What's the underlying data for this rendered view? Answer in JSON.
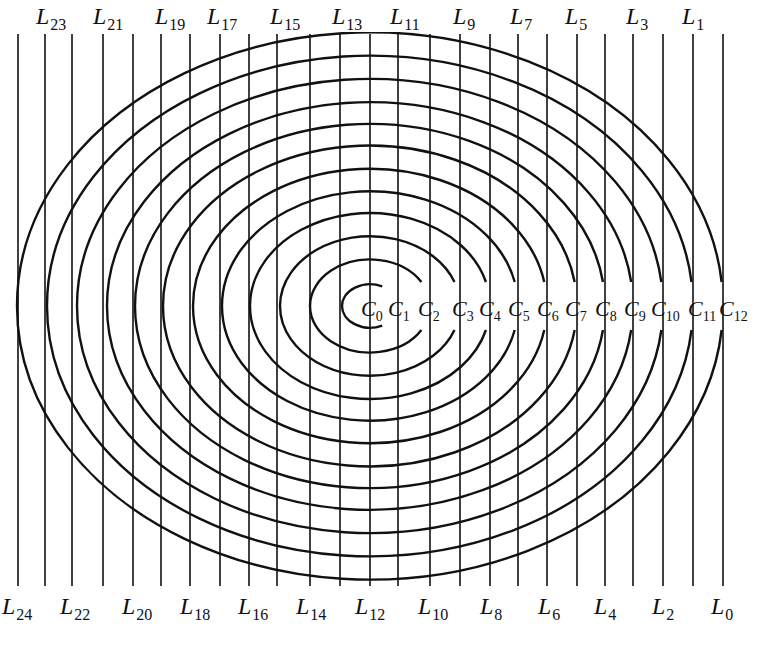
{
  "figure": {
    "center": {
      "x": 370,
      "y": 306
    },
    "y_scale": 0.775,
    "line_top": 34,
    "line_bottom": 586,
    "clip": {
      "top": 32,
      "bottom": 588
    },
    "stroke_color": "#111111",
    "line_x": [
      723,
      693,
      663,
      633,
      605,
      577,
      547,
      518,
      490,
      460,
      430,
      398,
      370,
      340,
      310,
      277,
      249,
      220,
      190,
      161,
      133,
      103,
      72,
      45,
      18
    ],
    "gap_half_height": 24
  },
  "top_labels": [
    {
      "main": "L",
      "sub": "23",
      "x": 36
    },
    {
      "main": "L",
      "sub": "21",
      "x": 93
    },
    {
      "main": "L",
      "sub": "19",
      "x": 155
    },
    {
      "main": "L",
      "sub": "17",
      "x": 207
    },
    {
      "main": "L",
      "sub": "15",
      "x": 270
    },
    {
      "main": "L",
      "sub": "13",
      "x": 332
    },
    {
      "main": "L",
      "sub": "11",
      "x": 390
    },
    {
      "main": "L",
      "sub": "9",
      "x": 453
    },
    {
      "main": "L",
      "sub": "7",
      "x": 510
    },
    {
      "main": "L",
      "sub": "5",
      "x": 565
    },
    {
      "main": "L",
      "sub": "3",
      "x": 626
    },
    {
      "main": "L",
      "sub": "1",
      "x": 682
    }
  ],
  "bottom_labels": [
    {
      "main": "L",
      "sub": "24",
      "x": 2
    },
    {
      "main": "L",
      "sub": "22",
      "x": 60
    },
    {
      "main": "L",
      "sub": "20",
      "x": 122
    },
    {
      "main": "L",
      "sub": "18",
      "x": 180
    },
    {
      "main": "L",
      "sub": "16",
      "x": 238
    },
    {
      "main": "L",
      "sub": "14",
      "x": 296
    },
    {
      "main": "L",
      "sub": "12",
      "x": 355
    },
    {
      "main": "L",
      "sub": "10",
      "x": 418
    },
    {
      "main": "L",
      "sub": "8",
      "x": 480
    },
    {
      "main": "L",
      "sub": "6",
      "x": 538
    },
    {
      "main": "L",
      "sub": "4",
      "x": 594
    },
    {
      "main": "L",
      "sub": "2",
      "x": 652
    },
    {
      "main": "L",
      "sub": "0",
      "x": 711
    }
  ],
  "center_labels": [
    {
      "main": "C",
      "sub": "0",
      "x": 361
    },
    {
      "main": "C",
      "sub": "1",
      "x": 388
    },
    {
      "main": "C",
      "sub": "2",
      "x": 418
    },
    {
      "main": "C",
      "sub": "3",
      "x": 452
    },
    {
      "main": "C",
      "sub": "4",
      "x": 479
    },
    {
      "main": "C",
      "sub": "5",
      "x": 508
    },
    {
      "main": "C",
      "sub": "6",
      "x": 537
    },
    {
      "main": "C",
      "sub": "7",
      "x": 565
    },
    {
      "main": "C",
      "sub": "8",
      "x": 595
    },
    {
      "main": "C",
      "sub": "9",
      "x": 624
    },
    {
      "main": "C",
      "sub": "10",
      "x": 651
    },
    {
      "main": "C",
      "sub": "11",
      "x": 688
    },
    {
      "main": "C",
      "sub": "12",
      "x": 719
    }
  ]
}
